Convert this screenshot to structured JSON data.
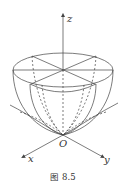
{
  "figure": {
    "caption": "图 8.5",
    "axes": {
      "z_label": "z",
      "x_label": "x",
      "y_label": "y",
      "origin_label": "O"
    },
    "colors": {
      "stroke": "#444444",
      "background": "#ffffff"
    }
  }
}
